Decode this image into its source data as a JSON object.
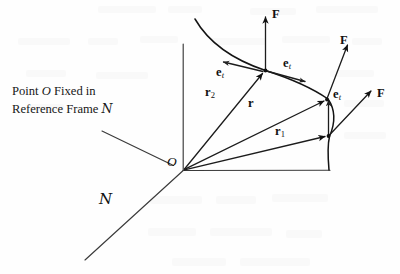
{
  "figure": {
    "type": "physics-vector-diagram",
    "background_color": "#fefefe",
    "ink_color": "#111111",
    "width": 400,
    "height": 274
  },
  "caption": {
    "line1_prefix": "Point ",
    "line1_italic": "O",
    "line1_suffix": " Fixed in",
    "line2_prefix": "Reference Frame ",
    "line2_script": "N"
  },
  "origin": {
    "label": "O"
  },
  "frame": {
    "label": "N"
  },
  "vectors": [
    {
      "name": "r2",
      "bold": "r",
      "sub": "2"
    },
    {
      "name": "r",
      "bold": "r",
      "sub": ""
    },
    {
      "name": "r1",
      "bold": "r",
      "sub": "1"
    }
  ],
  "tangent_labels": [
    {
      "name": "et-upper-left",
      "bold": "e",
      "sub": "t"
    },
    {
      "name": "et-upper-right",
      "bold": "e",
      "sub": "t"
    },
    {
      "name": "et-lower",
      "bold": "e",
      "sub": "t"
    }
  ],
  "force_labels": [
    {
      "name": "F-top",
      "bold": "F"
    },
    {
      "name": "F-middle",
      "bold": "F"
    },
    {
      "name": "F-right",
      "bold": "F"
    }
  ]
}
